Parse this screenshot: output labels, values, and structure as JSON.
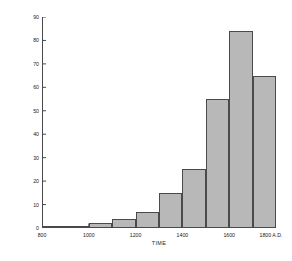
{
  "chart_data": {
    "type": "bar",
    "title": "",
    "xlabel": "TIME",
    "ylabel": "NO. OF RESIDENTIAL SITES",
    "xlim": [
      800,
      1800
    ],
    "ylim": [
      0,
      90
    ],
    "grid": false,
    "legend": null,
    "bin_width": 100,
    "x_tick_labels": [
      "800",
      "1000",
      "1200",
      "1400",
      "1600",
      "1800 A.D."
    ],
    "x_tick_values": [
      800,
      1000,
      1200,
      1400,
      1600,
      1800
    ],
    "y_tick_labels": [
      "0",
      "10",
      "20",
      "30",
      "40",
      "50",
      "60",
      "70",
      "80",
      "90"
    ],
    "y_tick_values": [
      0,
      10,
      20,
      30,
      40,
      50,
      60,
      70,
      80,
      90
    ],
    "categories": [
      "800-900",
      "900-1000",
      "1000-1100",
      "1100-1200",
      "1200-1300",
      "1300-1400",
      "1400-1500",
      "1500-1600",
      "1600-1700",
      "1700-1800"
    ],
    "bin_starts": [
      800,
      900,
      1000,
      1100,
      1200,
      1300,
      1400,
      1500,
      1600,
      1700
    ],
    "values": [
      1,
      1,
      2,
      4,
      7,
      15,
      25,
      55,
      84,
      65
    ],
    "bar_color": "#b8b8b8",
    "bar_edge_color": "#4a4a4a",
    "axis_color": "#4a4a4a",
    "background_color": "#ffffff"
  }
}
